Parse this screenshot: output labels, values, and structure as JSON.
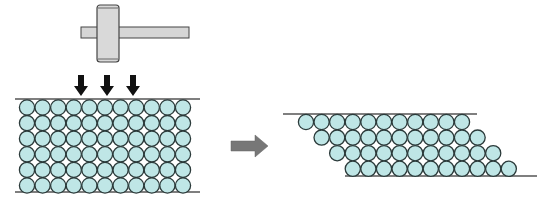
{
  "diagram": {
    "hammer": {
      "label": "hammer-icon",
      "face_color": "#d6d6d6",
      "outline_color": "#444444"
    },
    "force_arrows": {
      "count": 3,
      "color": "#111111"
    },
    "before_block": {
      "columns": 11,
      "rows": 6
    },
    "process_arrow": {
      "color": "#777777"
    },
    "after_block": {
      "rows": 4,
      "circles_per_row": 11,
      "shift_per_row_in_atoms": 1
    },
    "atom_fill": "#bfe6e6",
    "atom_stroke": "#2b3a3a",
    "boundary_line_color": "#555555"
  },
  "caption": ""
}
